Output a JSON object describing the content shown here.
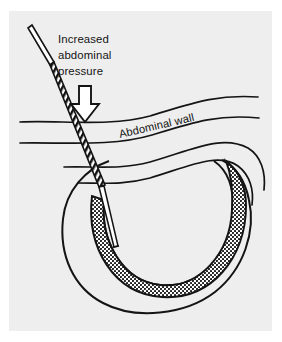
{
  "figure": {
    "name": "abdominal-hernia-needle-diagram",
    "caption_present": false,
    "background_color": "#ffffff",
    "panel_color": "#eeeeee",
    "ink_color": "#141414"
  },
  "labels": {
    "pressure_line1": "Increased",
    "pressure_line2": "abdominal",
    "pressure_line3": "pressure",
    "abdominal_wall": "Abdominal wall"
  },
  "icons": {
    "down_arrow": "down-arrow-icon",
    "needle": "needle-icon",
    "needle_graduated_section": "graduated-shaft-icon",
    "needle_tip": "needle-tip-icon"
  },
  "anatomy": {
    "outer_sac_label": "hernia-sac-outline",
    "inner_viscus_label": "viscus-wall-outline",
    "fluid_label": "stippled-fluid-collection",
    "wall_layers": [
      "abdominal-wall-line-1",
      "abdominal-wall-line-2",
      "abdominal-wall-line-3",
      "abdominal-wall-line-4"
    ]
  }
}
